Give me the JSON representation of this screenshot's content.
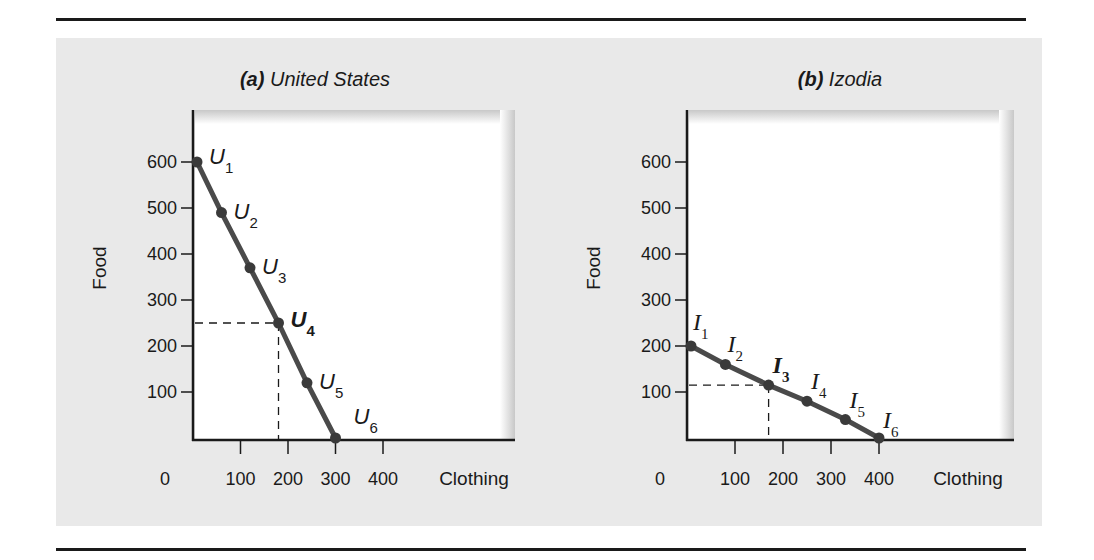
{
  "figure": {
    "panels": [
      {
        "id": "a",
        "title_letter": "(a)",
        "title_text": " United States",
        "point_prefix": "U",
        "highlight_index": 3
      },
      {
        "id": "b",
        "title_letter": "(b)",
        "title_text": " Izodia",
        "point_prefix": "I",
        "highlight_index": 2
      }
    ],
    "y_tick_labels": [
      "600",
      "500",
      "400",
      "300",
      "200",
      "100"
    ],
    "x_tick_labels": [
      "0",
      "100",
      "200",
      "300",
      "400"
    ],
    "x_axis_label": "Clothing",
    "y_axis_label": "Food"
  },
  "chart_data": [
    {
      "type": "line",
      "title": "(a) United States",
      "xlabel": "Clothing",
      "ylabel": "Food",
      "xlim": [
        0,
        400
      ],
      "ylim": [
        0,
        600
      ],
      "x_ticks": [
        0,
        100,
        200,
        300,
        400
      ],
      "y_ticks": [
        100,
        200,
        300,
        400,
        500,
        600
      ],
      "grid": false,
      "series": [
        {
          "name": "Production possibilities (United States)",
          "points": [
            {
              "label": "U1",
              "x": 0,
              "y": 600
            },
            {
              "label": "U2",
              "x": 60,
              "y": 490
            },
            {
              "label": "U3",
              "x": 120,
              "y": 370
            },
            {
              "label": "U4",
              "x": 180,
              "y": 250
            },
            {
              "label": "U5",
              "x": 240,
              "y": 120
            },
            {
              "label": "U6",
              "x": 300,
              "y": 0
            }
          ]
        }
      ],
      "annotations": [
        {
          "type": "dashed-guide",
          "point": "U4",
          "x": 180,
          "y": 250,
          "emphasis": "bold label"
        }
      ]
    },
    {
      "type": "line",
      "title": "(b) Izodia",
      "xlabel": "Clothing",
      "ylabel": "Food",
      "xlim": [
        0,
        400
      ],
      "ylim": [
        0,
        600
      ],
      "x_ticks": [
        0,
        100,
        200,
        300,
        400
      ],
      "y_ticks": [
        100,
        200,
        300,
        400,
        500,
        600
      ],
      "grid": false,
      "series": [
        {
          "name": "Production possibilities (Izodia)",
          "points": [
            {
              "label": "I1",
              "x": 0,
              "y": 200
            },
            {
              "label": "I2",
              "x": 80,
              "y": 160
            },
            {
              "label": "I3",
              "x": 170,
              "y": 115
            },
            {
              "label": "I4",
              "x": 250,
              "y": 80
            },
            {
              "label": "I5",
              "x": 330,
              "y": 40
            },
            {
              "label": "I6",
              "x": 400,
              "y": 0
            }
          ]
        }
      ],
      "annotations": [
        {
          "type": "dashed-guide",
          "point": "I3",
          "x": 170,
          "y": 115,
          "emphasis": "bold label"
        }
      ]
    }
  ],
  "colors": {
    "background_panel": "#e9e9e9",
    "plot_area": "#ffffff",
    "curve": "#4a4a4a",
    "axis": "#1a1a1a"
  }
}
